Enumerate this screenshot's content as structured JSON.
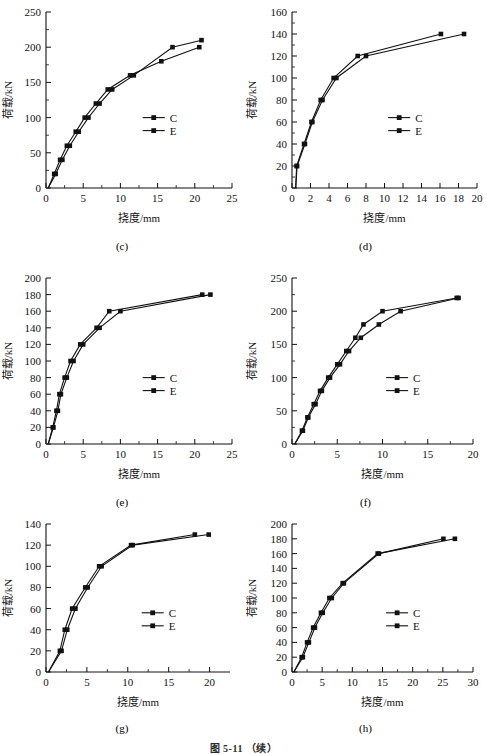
{
  "figure": {
    "caption": "图 5-11 （续）"
  },
  "common": {
    "xlabel": "挠度/mm",
    "ylabel": "荷载/kN",
    "legend": [
      {
        "name": "C",
        "marker": "square"
      },
      {
        "name": "E",
        "marker": "square"
      }
    ]
  },
  "chart_data": [
    {
      "type": "line",
      "panel": "(c)",
      "title": "",
      "xlabel": "挠度/mm",
      "ylabel": "荷载/kN",
      "xlim": [
        0,
        25
      ],
      "ylim": [
        0,
        250
      ],
      "xticks": [
        0,
        5,
        10,
        15,
        20,
        25
      ],
      "yticks": [
        0,
        50,
        100,
        150,
        200,
        250
      ],
      "grid": false,
      "legend_position": "center-right",
      "series": [
        {
          "name": "C",
          "x": [
            0.3,
            1.1,
            1.9,
            2.8,
            4.0,
            5.2,
            6.7,
            8.3,
            11.3,
            15.5,
            20.6
          ],
          "y": [
            0,
            20,
            40,
            60,
            80,
            100,
            120,
            140,
            160,
            180,
            200
          ]
        },
        {
          "name": "E",
          "x": [
            0.3,
            1.3,
            2.2,
            3.2,
            4.4,
            5.7,
            7.2,
            8.9,
            11.8,
            17.0,
            20.9
          ],
          "y": [
            0,
            20,
            40,
            60,
            80,
            100,
            120,
            140,
            160,
            200,
            210
          ]
        }
      ]
    },
    {
      "type": "line",
      "panel": "(d)",
      "title": "",
      "xlabel": "挠度/mm",
      "ylabel": "荷载/kN",
      "xlim": [
        0,
        20
      ],
      "ylim": [
        0,
        160
      ],
      "xticks": [
        0,
        2,
        4,
        6,
        8,
        10,
        12,
        14,
        16,
        18,
        20
      ],
      "yticks": [
        0,
        20,
        40,
        60,
        80,
        100,
        120,
        140,
        160
      ],
      "grid": false,
      "legend_position": "center-right",
      "series": [
        {
          "name": "C",
          "x": [
            0.4,
            0.5,
            1.3,
            2.1,
            3.1,
            4.5,
            7.1,
            16.1
          ],
          "y": [
            0,
            20,
            40,
            60,
            80,
            100,
            120,
            140
          ]
        },
        {
          "name": "E",
          "x": [
            0.4,
            0.55,
            1.4,
            2.2,
            3.3,
            4.8,
            8.0,
            18.6
          ],
          "y": [
            0,
            20,
            40,
            60,
            80,
            100,
            120,
            140
          ]
        }
      ]
    },
    {
      "type": "line",
      "panel": "(e)",
      "title": "",
      "xlabel": "挠度/mm",
      "ylabel": "荷载/kN",
      "xlim": [
        0,
        25
      ],
      "ylim": [
        0,
        200
      ],
      "xticks": [
        0,
        5,
        10,
        15,
        20,
        25
      ],
      "yticks": [
        0,
        20,
        40,
        60,
        80,
        100,
        120,
        140,
        160,
        180,
        200
      ],
      "grid": false,
      "legend_position": "center-right",
      "series": [
        {
          "name": "C",
          "x": [
            0.3,
            0.9,
            1.4,
            1.8,
            2.5,
            3.3,
            4.6,
            6.8,
            8.5,
            21.0
          ],
          "y": [
            0,
            20,
            40,
            60,
            80,
            100,
            120,
            140,
            160,
            180
          ]
        },
        {
          "name": "E",
          "x": [
            0.3,
            1.0,
            1.6,
            2.0,
            2.8,
            3.7,
            5.0,
            7.2,
            10.0,
            22.1
          ],
          "y": [
            0,
            20,
            40,
            60,
            80,
            100,
            120,
            140,
            160,
            180
          ]
        }
      ]
    },
    {
      "type": "line",
      "panel": "(f)",
      "title": "",
      "xlabel": "挠度/mm",
      "ylabel": "荷载/kN",
      "xlim": [
        0,
        20
      ],
      "ylim": [
        0,
        250
      ],
      "xticks": [
        0,
        5,
        10,
        15,
        20
      ],
      "yticks": [
        0,
        50,
        100,
        150,
        200,
        250
      ],
      "grid": false,
      "legend_position": "center-right",
      "series": [
        {
          "name": "C",
          "x": [
            0.3,
            1.1,
            1.7,
            2.4,
            3.1,
            4.0,
            5.0,
            6.0,
            7.0,
            7.9,
            10.0,
            18.2
          ],
          "y": [
            0,
            20,
            40,
            60,
            80,
            100,
            120,
            140,
            160,
            180,
            200,
            220
          ]
        },
        {
          "name": "E",
          "x": [
            0.3,
            1.2,
            1.8,
            2.6,
            3.3,
            4.2,
            5.3,
            6.3,
            7.6,
            9.6,
            12.0,
            18.4
          ],
          "y": [
            0,
            20,
            40,
            60,
            80,
            100,
            120,
            140,
            160,
            180,
            200,
            220
          ]
        }
      ]
    },
    {
      "type": "line",
      "panel": "(g)",
      "title": "",
      "xlabel": "挠度/mm",
      "ylabel": "荷载/kN",
      "xlim": [
        0,
        22.5
      ],
      "ylim": [
        0,
        140
      ],
      "xticks": [
        0,
        5,
        10,
        15,
        20
      ],
      "yticks": [
        0,
        20,
        40,
        60,
        80,
        100,
        120,
        140
      ],
      "grid": false,
      "legend_position": "center-right",
      "series": [
        {
          "name": "C",
          "x": [
            0.3,
            1.7,
            2.3,
            3.2,
            4.8,
            6.5,
            10.4,
            18.2
          ],
          "y": [
            0,
            20,
            40,
            60,
            80,
            100,
            120,
            130
          ]
        },
        {
          "name": "E",
          "x": [
            0.3,
            1.9,
            2.6,
            3.6,
            5.1,
            6.8,
            10.6,
            19.9
          ],
          "y": [
            0,
            20,
            40,
            60,
            80,
            100,
            120,
            130
          ]
        }
      ]
    },
    {
      "type": "line",
      "panel": "(h)",
      "title": "",
      "xlabel": "挠度/mm",
      "ylabel": "荷载/kN",
      "xlim": [
        0,
        30
      ],
      "ylim": [
        0,
        200
      ],
      "xticks": [
        0,
        5,
        10,
        15,
        20,
        25,
        30
      ],
      "yticks": [
        0,
        20,
        40,
        60,
        80,
        100,
        120,
        140,
        160,
        180,
        200
      ],
      "grid": false,
      "legend_position": "center-right",
      "series": [
        {
          "name": "C",
          "x": [
            0.3,
            1.6,
            2.5,
            3.5,
            4.8,
            6.2,
            8.4,
            14.2,
            27.0
          ],
          "y": [
            0,
            20,
            40,
            60,
            80,
            100,
            120,
            160,
            180
          ]
        },
        {
          "name": "E",
          "x": [
            0.3,
            1.8,
            2.8,
            3.8,
            5.1,
            6.6,
            8.6,
            14.4,
            25.1
          ],
          "y": [
            0,
            20,
            40,
            60,
            80,
            100,
            120,
            160,
            180
          ]
        }
      ]
    }
  ]
}
